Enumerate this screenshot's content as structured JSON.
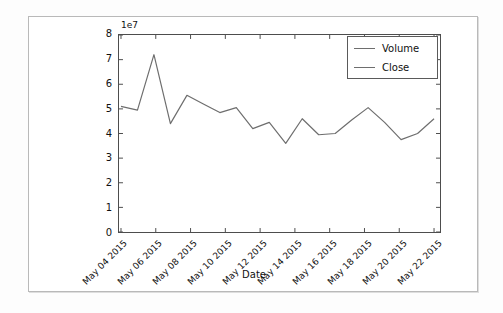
{
  "chart_data": {
    "type": "line",
    "title": "",
    "xlabel": "Date",
    "ylabel": "",
    "y_offset_text": "1e7",
    "y_multiplier": 10000000,
    "ylim": [
      0,
      8
    ],
    "yticks": [
      0,
      1,
      2,
      3,
      4,
      5,
      6,
      7,
      8
    ],
    "ytick_labels": [
      "0",
      "1",
      "2",
      "3",
      "4",
      "5",
      "6",
      "7",
      "8"
    ],
    "xtick_labels": [
      "May 04 2015",
      "May 06 2015",
      "May 08 2015",
      "May 10 2015",
      "May 12 2015",
      "May 14 2015",
      "May 16 2015",
      "May 18 2015",
      "May 20 2015",
      "May 22 2015"
    ],
    "grid": false,
    "legend_position": "upper right",
    "legend": [
      "Volume",
      "Close"
    ],
    "series": [
      {
        "name": "Volume",
        "color": "#6e6e6e",
        "x": [
          0,
          1,
          2,
          3,
          4,
          5,
          6,
          7,
          8,
          9,
          10,
          11,
          12,
          13,
          14,
          15,
          16,
          17,
          18,
          19
        ],
        "x_labels": [
          "May 04 2015",
          "May 05 2015",
          "May 06 2015",
          "May 07 2015",
          "May 08 2015",
          "May 09 2015",
          "May 10 2015",
          "May 11 2015",
          "May 12 2015",
          "May 13 2015",
          "May 14 2015",
          "May 15 2015",
          "May 16 2015",
          "May 17 2015",
          "May 18 2015",
          "May 19 2015",
          "May 20 2015",
          "May 21 2015",
          "May 22 2015",
          "May 23 2015"
        ],
        "values": [
          5.1,
          4.95,
          7.2,
          4.4,
          5.55,
          5.2,
          4.85,
          5.05,
          4.2,
          4.45,
          3.6,
          4.6,
          3.95,
          4.0,
          4.55,
          5.05,
          4.45,
          3.75,
          4.0,
          4.6
        ]
      },
      {
        "name": "Close",
        "color": "#6e6e6e",
        "x": [],
        "values": []
      }
    ]
  },
  "axes": {
    "y_offset_label": "1e7",
    "x_axis_title": "Date"
  }
}
